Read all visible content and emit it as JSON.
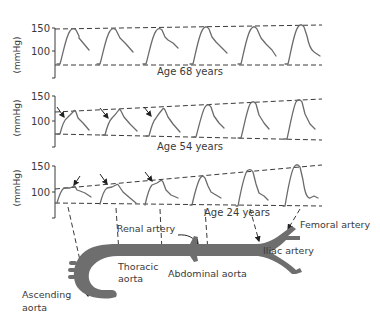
{
  "figure": {
    "panels": [
      {
        "id": "age68",
        "label": "Age 68 years",
        "y_axis_label": "(mmHg)",
        "y_ticks": [
          "150",
          "100"
        ],
        "upper_envelope": "flat (~150)",
        "lower_envelope": "flat (~75)",
        "arrows": false
      },
      {
        "id": "age54",
        "label": "Age 54 years",
        "y_axis_label": "(mmHg)",
        "y_ticks": [
          "150",
          "100"
        ],
        "upper_envelope": "rising (~120 to ~145)",
        "lower_envelope": "slightly falling (~75 to ~70)",
        "arrows": true
      },
      {
        "id": "age24",
        "label": "Age 24 years",
        "y_axis_label": "(mmHg)",
        "y_ticks": [
          "150",
          "100"
        ],
        "upper_envelope": "rising (~108 to ~150)",
        "lower_envelope": "flat (~78)",
        "arrows": true
      }
    ],
    "anatomy": {
      "labels": {
        "renal": "Renal artery",
        "femoral": "Femoral artery",
        "iliac": "Iliac artery",
        "thoracic_line1": "Thoracic",
        "thoracic_line2": "aorta",
        "abdominal": "Abdominal aorta",
        "ascending_line1": "Ascending",
        "ascending_line2": "aorta"
      }
    },
    "colors": {
      "vessel": "#6e6e6e",
      "wave": "#6b6b6b",
      "text": "#3a3a3a"
    }
  }
}
